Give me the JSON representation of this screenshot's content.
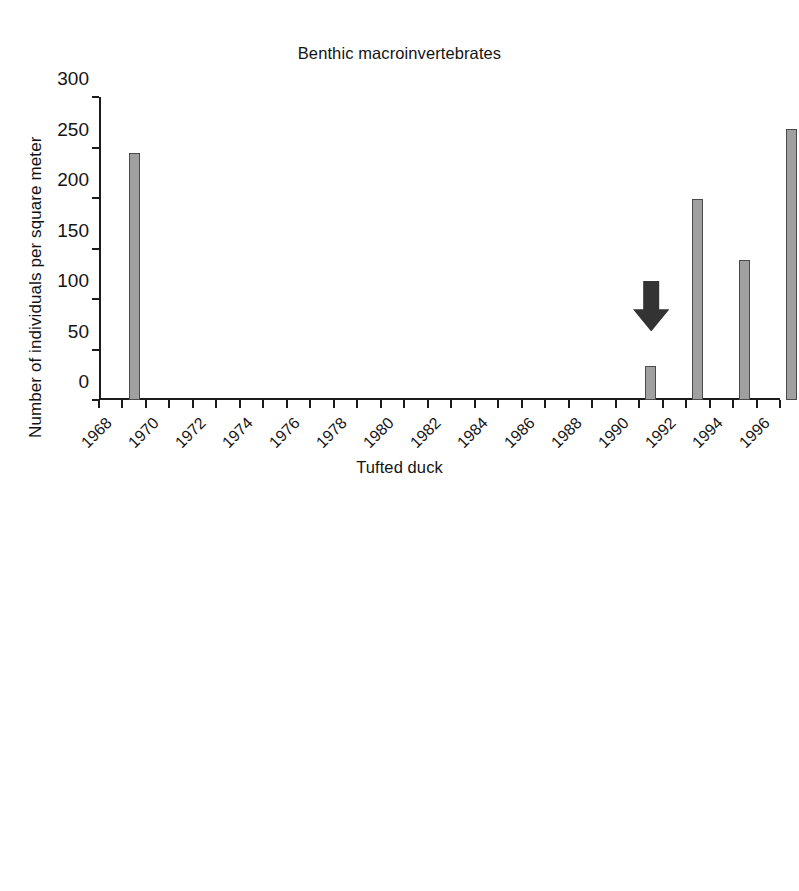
{
  "figure": {
    "background": "#ffffff",
    "bar_fill": "#a0a0a0",
    "bar_stroke": "#4a4a4a",
    "arrow_color": "#333333",
    "axis_color": "#1b1b1b"
  },
  "panels": [
    {
      "id": "benthic",
      "title": "Benthic macroinvertebrates",
      "ylabel": "Number of individuals per square meter",
      "arrow": {
        "name": "down-arrow-annotation",
        "year": 1990.5,
        "top_value": 118,
        "bottom_value": 68
      }
    },
    {
      "id": "tufted-duck",
      "title": "Tufted duck",
      "ylabel": "Number of individuals",
      "arrow": {
        "name": "down-arrow-annotation",
        "year": 1990.5,
        "top_value": 288,
        "bottom_value": 172
      }
    }
  ],
  "chart_data": [
    {
      "type": "bar",
      "title": "Benthic macroinvertebrates",
      "xlabel": "",
      "ylabel": "Number of individuals per square meter",
      "ylim": [
        0,
        300
      ],
      "yticks": [
        0,
        50,
        100,
        150,
        200,
        250,
        300
      ],
      "ytick_labels": [
        "0",
        "50",
        "100",
        "150",
        "200",
        "250",
        "300"
      ],
      "xlim": [
        1968,
        1997
      ],
      "xticks": [
        1968,
        1969,
        1970,
        1971,
        1972,
        1973,
        1974,
        1975,
        1976,
        1977,
        1978,
        1979,
        1980,
        1981,
        1982,
        1983,
        1984,
        1985,
        1986,
        1987,
        1988,
        1989,
        1990,
        1991,
        1992,
        1993,
        1994,
        1995,
        1996,
        1997
      ],
      "xtick_labels": [
        "1968",
        "1970",
        "1972",
        "1974",
        "1976",
        "1978",
        "1980",
        "1982",
        "1984",
        "1986",
        "1988",
        "1990",
        "1992",
        "1994",
        "1996"
      ],
      "xtick_label_years": [
        1968,
        1970,
        1972,
        1974,
        1976,
        1978,
        1980,
        1982,
        1984,
        1986,
        1988,
        1990,
        1992,
        1994,
        1996
      ],
      "xtick_label_rotation": -45,
      "grid": false,
      "legend": false,
      "categories": [
        1969,
        1991,
        1993,
        1995,
        1997
      ],
      "values": [
        245,
        34,
        199,
        139,
        268
      ],
      "annotations": [
        {
          "text": "",
          "symbol": "down-arrow",
          "x": 1991,
          "y_top": 118,
          "y_bottom": 68
        }
      ]
    },
    {
      "type": "bar",
      "title": "Tufted duck",
      "xlabel": "",
      "ylabel": "Number of individuals",
      "ylim": [
        0,
        600
      ],
      "yticks": [
        0,
        100,
        200,
        300,
        400,
        500,
        600
      ],
      "ytick_labels": [
        "0",
        "100",
        "200",
        "300",
        "400",
        "500",
        "600"
      ],
      "xlim": [
        1968,
        1997
      ],
      "xticks": [
        1968,
        1969,
        1970,
        1971,
        1972,
        1973,
        1974,
        1975,
        1976,
        1977,
        1978,
        1979,
        1980,
        1981,
        1982,
        1983,
        1984,
        1985,
        1986,
        1987,
        1988,
        1989,
        1990,
        1991,
        1992,
        1993,
        1994,
        1995,
        1996,
        1997
      ],
      "xtick_labels": [
        "1968",
        "1970",
        "1972",
        "1974",
        "1976",
        "1978",
        "1980",
        "1982",
        "1984",
        "1986",
        "1988",
        "1990",
        "1992",
        "1994",
        "1996"
      ],
      "xtick_label_years": [
        1968,
        1970,
        1972,
        1974,
        1976,
        1978,
        1980,
        1982,
        1984,
        1986,
        1988,
        1990,
        1992,
        1994,
        1996
      ],
      "xtick_label_rotation": -45,
      "grid": false,
      "legend": false,
      "categories": [
        1968,
        1971,
        1972,
        1973,
        1974,
        1975,
        1976,
        1977,
        1978,
        1989,
        1990,
        1991,
        1992,
        1993,
        1994,
        1995,
        1996
      ],
      "values": [
        570,
        325,
        205,
        28,
        46,
        29,
        4,
        2,
        8,
        3,
        48,
        118,
        88,
        97,
        182,
        227,
        258
      ],
      "annotations": [
        {
          "text": "",
          "symbol": "down-arrow",
          "x": 1991,
          "y_top": 288,
          "y_bottom": 172
        }
      ]
    }
  ]
}
